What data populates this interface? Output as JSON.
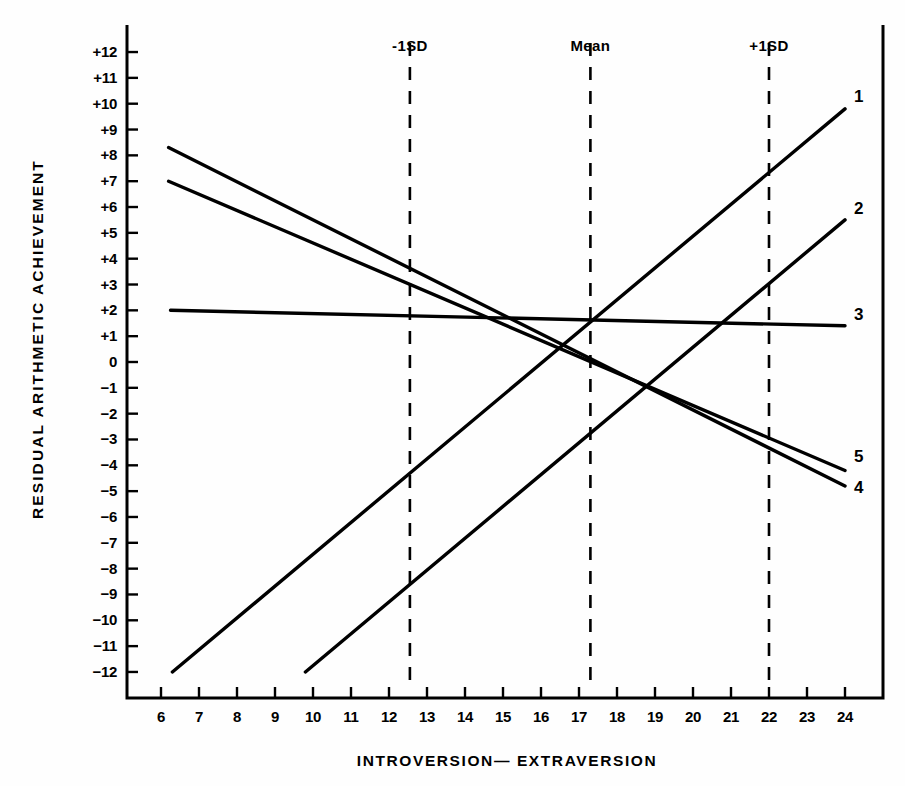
{
  "chart_data": {
    "type": "line",
    "title": "",
    "xlabel": "INTROVERSION— EXTRAVERSION",
    "ylabel": "RESIDUAL ARITHMETIC ACHIEVEMENT",
    "xlim": [
      5.6,
      24.6
    ],
    "ylim": [
      -12.6,
      12.6
    ],
    "grid": false,
    "legend_position": "right-edge-inline",
    "xticks": [
      6,
      7,
      8,
      9,
      10,
      11,
      12,
      13,
      14,
      15,
      16,
      17,
      18,
      19,
      20,
      21,
      22,
      23,
      24
    ],
    "xtick_labels": [
      "6",
      "7",
      "8",
      "9",
      "10",
      "11",
      "12",
      "13",
      "14",
      "15",
      "16",
      "17",
      "18",
      "19",
      "20",
      "21",
      "22",
      "23",
      "24"
    ],
    "yticks": [
      12,
      11,
      10,
      9,
      8,
      7,
      6,
      5,
      4,
      3,
      2,
      1,
      0,
      -1,
      -2,
      -3,
      -4,
      -5,
      -6,
      -7,
      -8,
      -9,
      -10,
      -11,
      -12
    ],
    "ytick_labels": [
      "+12",
      "+11",
      "+10",
      "+9",
      "+8",
      "+7",
      "+6",
      "+5",
      "+4",
      "+3",
      "+2",
      "+1",
      "0",
      "−1",
      "−2",
      "−3",
      "−4",
      "−5",
      "−6",
      "−7",
      "−8",
      "−9",
      "−10",
      "−11",
      "−12"
    ],
    "annotations": [
      {
        "label": "-1SD",
        "x": 12.55,
        "type": "vertical-dashed-line"
      },
      {
        "label": "Mean",
        "x": 17.3,
        "type": "vertical-dashed-line"
      },
      {
        "label": "+1SD",
        "x": 22.0,
        "type": "vertical-dashed-line"
      }
    ],
    "series": [
      {
        "name": "1",
        "label": "1",
        "x": [
          6.3,
          24.0
        ],
        "y": [
          -12.0,
          9.8
        ]
      },
      {
        "name": "2",
        "label": "2",
        "x": [
          9.8,
          24.0
        ],
        "y": [
          -12.0,
          5.5
        ]
      },
      {
        "name": "3",
        "label": "3",
        "x": [
          6.25,
          24.0
        ],
        "y": [
          2.0,
          1.4
        ]
      },
      {
        "name": "4",
        "label": "4",
        "x": [
          6.2,
          24.0
        ],
        "y": [
          8.3,
          -4.8
        ]
      },
      {
        "name": "5",
        "label": "5",
        "x": [
          6.2,
          24.0
        ],
        "y": [
          7.0,
          -4.2
        ]
      }
    ]
  },
  "style": {
    "ink": "#000000",
    "paper": "#fefefe",
    "line_width": 3.4,
    "axis_width": 3.0
  }
}
